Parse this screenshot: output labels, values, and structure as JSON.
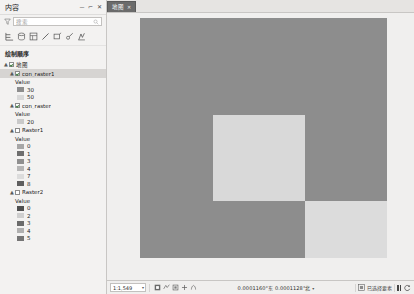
{
  "pane": {
    "title": "内容",
    "buttons": {
      "minimize": "－",
      "pin": "⌐",
      "close": "✕"
    },
    "search": {
      "value": "搜索",
      "placeholder": "搜索"
    },
    "toolbar_icons": [
      "list-by-drawing-order-icon",
      "list-by-data-source-icon",
      "list-by-selection-icon",
      "list-by-editing-icon",
      "list-by-snapping-icon",
      "list-by-labeling-icon",
      "list-by-diagram-icon"
    ],
    "drawing_order_label": "绘制顺序",
    "tree": [
      {
        "name": "地图",
        "type": "map-root",
        "expander": "▲",
        "checked": true,
        "indent": 0,
        "selected": false
      },
      {
        "name": "con_raster1",
        "type": "raster-layer",
        "expander": "▲",
        "checked": true,
        "indent": 1,
        "selected": true,
        "value_header": "Value",
        "legend": [
          {
            "label": "30",
            "color": "#8d8d8d"
          },
          {
            "label": "50",
            "color": "#d8d8d8"
          }
        ]
      },
      {
        "name": "con_raster",
        "type": "raster-layer",
        "expander": "▲",
        "checked": true,
        "indent": 1,
        "selected": false,
        "value_header": "Value",
        "legend": [
          {
            "label": "20",
            "color": "#c9c9c9"
          }
        ]
      },
      {
        "name": "Raster1",
        "type": "raster-layer",
        "expander": "▲",
        "checked": false,
        "indent": 1,
        "selected": false,
        "value_header": "Value",
        "legend": [
          {
            "label": "0",
            "color": "#a6a6a6"
          },
          {
            "label": "1",
            "color": "#6e6e6e"
          },
          {
            "label": "3",
            "color": "#8f8f8f"
          },
          {
            "label": "4",
            "color": "#b5b5b5"
          },
          {
            "label": "7",
            "color": "#dcdcdc"
          },
          {
            "label": "8",
            "color": "#5f5f5f"
          }
        ]
      },
      {
        "name": "Raster2",
        "type": "raster-layer",
        "expander": "▲",
        "checked": false,
        "indent": 1,
        "selected": false,
        "value_header": "Value",
        "legend": [
          {
            "label": "0",
            "color": "#4f4f4f"
          },
          {
            "label": "2",
            "color": "#cfcfcf"
          },
          {
            "label": "3",
            "color": "#6b6b6b"
          },
          {
            "label": "4",
            "color": "#b0b0b0"
          },
          {
            "label": "5",
            "color": "#757575"
          }
        ]
      }
    ]
  },
  "view": {
    "tab": {
      "label": "地图",
      "close": "✕"
    },
    "map": {
      "background": "#f0efee",
      "raster_base_color": "#8d8d8d",
      "blocks": [
        {
          "name": "center-light-square",
          "color": "#d9d9d9",
          "left": 73,
          "top": 97,
          "width": 92,
          "height": 86
        },
        {
          "name": "bottom-right-light-square",
          "color": "#dcdcdc",
          "left": 165,
          "top": 183,
          "width": 82,
          "height": 57
        }
      ]
    }
  },
  "status": {
    "scale": "1:1,549",
    "scale_caret": "▾",
    "nav_icons": [
      "selected-features-icon",
      "measure-icon",
      "pause-drawing-icon",
      "zoom-in-icon",
      "pan-icon"
    ],
    "coordinates": "0.0001160°东 0.0001128°北",
    "coordinates_caret": "▾",
    "selected_features_label": "已选择要素",
    "pause_label": "暂停绘制",
    "refresh_label": "刷新"
  }
}
